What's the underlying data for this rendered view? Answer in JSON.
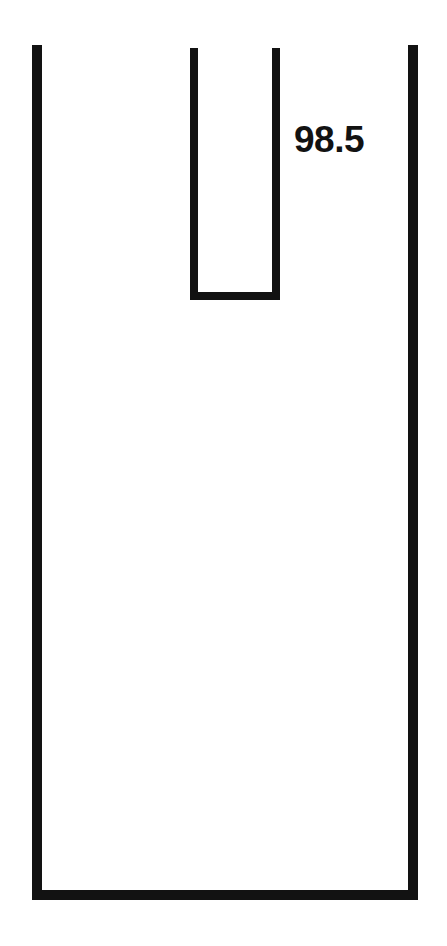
{
  "figure": {
    "kind": "technical-line-drawing",
    "background_color": "#ffffff",
    "stroke_color": "#121212",
    "canvas": {
      "width": 447,
      "height": 946
    },
    "labels": [
      {
        "name": "reference-numeral",
        "text": "98.5",
        "x": 294,
        "y": 121,
        "font_size": 37,
        "font_weight": "bold",
        "color": "#121212"
      }
    ],
    "shapes": [
      {
        "name": "outer-u-channel",
        "description": "Large U-shaped outline open at the top",
        "stroke_width": 10,
        "left_wall_x": 37,
        "right_wall_x": 413,
        "top_y": 45,
        "bottom_y": 895
      },
      {
        "name": "inner-u-slot",
        "description": "Smaller U-shaped slot open at the top, nested in upper middle area",
        "stroke_width": 8,
        "left_wall_x": 194,
        "right_wall_x": 276,
        "top_y": 48,
        "bottom_y": 296
      }
    ]
  }
}
